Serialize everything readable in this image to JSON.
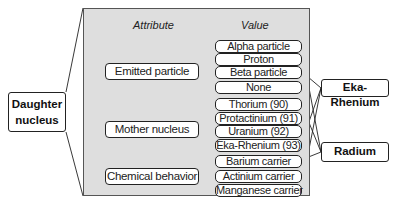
{
  "panel": {
    "attribute_header": "Attribute",
    "value_header": "Value"
  },
  "source": {
    "label_line1": "Daughter",
    "label_line2": "nucleus"
  },
  "attributes": [
    {
      "label": "Emitted particle",
      "values": [
        "Alpha particle",
        "Proton",
        "Beta particle",
        "None"
      ]
    },
    {
      "label": "Mother nucleus",
      "values": [
        "Thorium (90)",
        "Protactinium (91)",
        "Uranium (92)",
        "Eka-Rhenium (93)"
      ]
    },
    {
      "label": "Chemical behavior",
      "values": [
        "Barium carrier",
        "Actinium carrier",
        "Manganese carrier"
      ]
    }
  ],
  "outputs": [
    {
      "label": "Eka-Rhenium",
      "linked_values": [
        "Beta particle",
        "Eka-Rhenium (93)",
        "Manganese carrier"
      ]
    },
    {
      "label": "Radium",
      "linked_values": [
        "Alpha particle",
        "Thorium (90)",
        "Barium carrier"
      ]
    }
  ],
  "colors": {
    "panel_bg": "#dedede",
    "line": "#222222",
    "box_bg": "#ffffff"
  }
}
